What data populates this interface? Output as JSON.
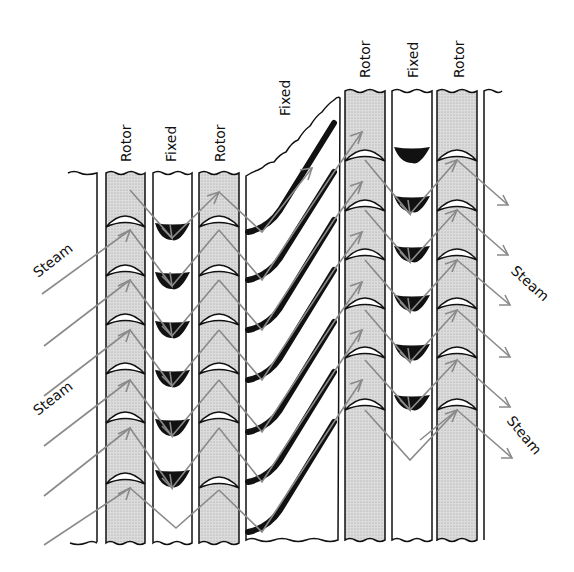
{
  "diagram": {
    "type": "steam turbine blade rows (impulse/reaction stages)",
    "column_labels": [
      "Rotor",
      "Fixed",
      "Rotor",
      "Fixed",
      "Rotor",
      "Fixed",
      "Rotor"
    ],
    "steam_labels": {
      "left_upper": "Steam",
      "left_lower": "Steam",
      "right_upper": "Steam",
      "right_lower": "Steam"
    },
    "colors": {
      "rotor_fill": "#d4d4d4",
      "flow_arrow": "#8a8a8a",
      "outline": "#111111",
      "fixed_blade": "#111111"
    }
  }
}
